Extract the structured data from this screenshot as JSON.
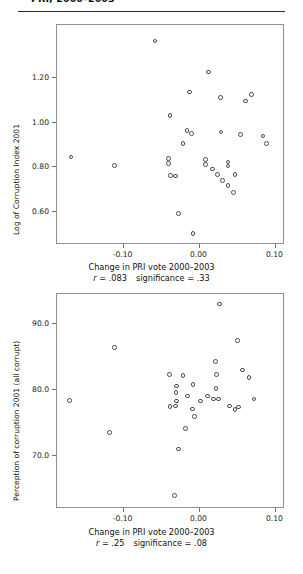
{
  "document": {
    "running_head": "PRI, 2000–2003",
    "page_background": "#ffffff",
    "rule_color": "#2b2b2b",
    "marker_color": "#4d4d55"
  },
  "figures": [
    {
      "id": "figure-top",
      "chart_data": {
        "type": "scatter",
        "title": "",
        "xlabel": "Change in PRI vote 2000–2003",
        "ylabel": "Log of Corruption Index 2001",
        "xlim": [
          -0.1875,
          0.1125
        ],
        "ylim": [
          0.45,
          1.44
        ],
        "xticks": [
          -0.1,
          0.0,
          0.1
        ],
        "xticklabels": [
          "-0.10",
          "0.00",
          "0.10"
        ],
        "yticks": [
          0.6,
          0.8,
          1.0,
          1.2
        ],
        "yticklabels": [
          "0.60",
          "0.80",
          "1.00",
          "1.20"
        ],
        "grid": false,
        "legend": false,
        "annotations": {
          "r_label": "r",
          "r_value": " = .083",
          "significance_label": "significance",
          "significance_value": " = .33",
          "text": "r = .083   significance = .33"
        },
        "points": [
          [
            -0.0588,
            1.368
          ],
          [
            -0.013,
            1.138
          ],
          [
            -0.0387,
            1.032
          ],
          [
            -0.0164,
            0.965
          ],
          [
            -0.0103,
            0.951
          ],
          [
            -0.0215,
            0.906
          ],
          [
            0.0121,
            1.228
          ],
          [
            0.0276,
            1.114
          ],
          [
            0.0284,
            0.958
          ],
          [
            0.0604,
            1.098
          ],
          [
            0.0684,
            1.127
          ],
          [
            0.0537,
            0.946
          ],
          [
            0.0835,
            0.94
          ],
          [
            0.0878,
            0.906
          ],
          [
            -0.1689,
            0.846
          ],
          [
            -0.1121,
            0.808
          ],
          [
            -0.0406,
            0.838
          ],
          [
            -0.0406,
            0.818
          ],
          [
            -0.0379,
            0.762
          ],
          [
            -0.0314,
            0.76
          ],
          [
            0.0078,
            0.836
          ],
          [
            0.0078,
            0.812
          ],
          [
            0.0171,
            0.792
          ],
          [
            0.0373,
            0.824
          ],
          [
            0.0373,
            0.806
          ],
          [
            0.0237,
            0.766
          ],
          [
            0.03,
            0.74
          ],
          [
            0.0467,
            0.766
          ],
          [
            0.0376,
            0.718
          ],
          [
            0.0444,
            0.686
          ],
          [
            -0.028,
            0.592
          ],
          [
            -0.0088,
            0.503
          ]
        ]
      }
    },
    {
      "id": "figure-bottom",
      "chart_data": {
        "type": "scatter",
        "title": "",
        "xlabel": "Change in PRI vote 2000–2003",
        "ylabel": "Perception of corruption 2001 (all corrupt)",
        "xlim": [
          -0.1875,
          0.1125
        ],
        "ylim": [
          62.0,
          94.5
        ],
        "xticks": [
          -0.1,
          0.0,
          0.1
        ],
        "xticklabels": [
          "-0.10",
          "0.00",
          "0.10"
        ],
        "yticks": [
          70.0,
          80.0,
          90.0
        ],
        "yticklabels": [
          "70.0",
          "80.0",
          "90.0"
        ],
        "grid": false,
        "legend": false,
        "annotations": {
          "r_label": "r",
          "r_value": " = .25",
          "significance_label": "significance",
          "significance_value": " = .08",
          "text": "r = .25   significance = .08"
        },
        "points": [
          [
            0.0262,
            93.0
          ],
          [
            -0.1116,
            86.4
          ],
          [
            0.05,
            87.5
          ],
          [
            0.0209,
            84.3
          ],
          [
            0.022,
            82.3
          ],
          [
            0.0216,
            80.2
          ],
          [
            0.0566,
            83.0
          ],
          [
            0.0652,
            81.9
          ],
          [
            -0.0395,
            82.3
          ],
          [
            -0.0218,
            82.2
          ],
          [
            -0.0304,
            80.6
          ],
          [
            -0.031,
            79.6
          ],
          [
            -0.0305,
            78.3
          ],
          [
            -0.0155,
            79.1
          ],
          [
            -0.0086,
            80.8
          ],
          [
            -0.039,
            77.5
          ],
          [
            -0.0315,
            77.6
          ],
          [
            0.0015,
            78.3
          ],
          [
            0.0107,
            79.1
          ],
          [
            0.0183,
            78.6
          ],
          [
            0.0247,
            78.6
          ],
          [
            0.0392,
            77.6
          ],
          [
            0.0466,
            77.0
          ],
          [
            0.0513,
            77.4
          ],
          [
            -0.0092,
            77.1
          ],
          [
            -0.1708,
            78.4
          ],
          [
            0.0716,
            78.6
          ],
          [
            -0.0065,
            76.0
          ],
          [
            -0.1184,
            73.6
          ],
          [
            -0.0188,
            74.2
          ],
          [
            -0.028,
            71.1
          ],
          [
            -0.033,
            64.0
          ]
        ]
      }
    }
  ]
}
